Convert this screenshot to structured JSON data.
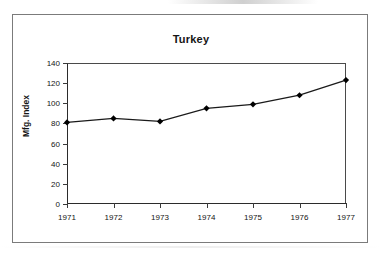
{
  "figure": {
    "title": "Turkey",
    "y_axis_title": "Mfg. Index"
  },
  "chart_data": {
    "type": "line",
    "title": "Turkey",
    "xlabel": "",
    "ylabel": "Mfg. Index",
    "categories": [
      "1971",
      "1972",
      "1973",
      "1974",
      "1975",
      "1976",
      "1977"
    ],
    "values": [
      81,
      85,
      82,
      95,
      99,
      108,
      123
    ],
    "series": [
      {
        "name": "Mfg. Index",
        "values": [
          81,
          85,
          82,
          95,
          99,
          108,
          123
        ]
      }
    ],
    "ylim": [
      0,
      140
    ],
    "y_ticks": [
      0,
      20,
      40,
      60,
      80,
      100,
      120,
      140
    ],
    "y_tick_labels": [
      "0",
      "20",
      "40",
      "60",
      "80",
      "100",
      "120",
      "140"
    ],
    "x_tick_labels": [
      "1971",
      "1972",
      "1973",
      "1974",
      "1975",
      "1976",
      "1977"
    ],
    "grid": false,
    "legend": false,
    "marker": "diamond",
    "line_color": "#1a1a1a",
    "marker_color": "#000000"
  }
}
